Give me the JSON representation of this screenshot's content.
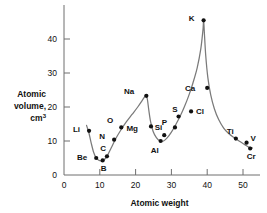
{
  "chart_data": {
    "type": "line",
    "title": "",
    "xlabel": "Atomic weight",
    "ylabel": "Atomic volume, cm3",
    "ylabel_lines": [
      "Atomic",
      "volume,",
      "cm"
    ],
    "ylabel_superscript": "3",
    "xlim": [
      0,
      53
    ],
    "ylim": [
      0,
      46
    ],
    "xticks": [
      0,
      10,
      20,
      30,
      40,
      50
    ],
    "yticks": [
      0,
      10,
      20,
      30,
      40
    ],
    "xtick_labels": [
      "0",
      "10",
      "20",
      "30",
      "40",
      "50"
    ],
    "ytick_labels": [
      "0",
      "10",
      "20",
      "30",
      "40"
    ],
    "grid": false,
    "legend": false,
    "series_name": "Atomic volume",
    "points": [
      {
        "label": "Li",
        "x": 7.0,
        "y": 13.0,
        "lx": -9,
        "ly": 1
      },
      {
        "label": "Be",
        "x": 9.0,
        "y": 5.0,
        "lx": -9,
        "ly": 2
      },
      {
        "label": "B",
        "x": 10.8,
        "y": 4.3,
        "lx": 1,
        "ly": 11
      },
      {
        "label": "C",
        "x": 12.0,
        "y": 5.5,
        "lx": -1,
        "ly": -5
      },
      {
        "label": "N",
        "x": 14.0,
        "y": 10.4,
        "lx": -9,
        "ly": -1
      },
      {
        "label": "O",
        "x": 16.0,
        "y": 14.0,
        "lx": -8,
        "ly": -4
      },
      {
        "label": "Na",
        "x": 23.0,
        "y": 23.3,
        "lx": -12,
        "ly": -2
      },
      {
        "label": "Mg",
        "x": 24.3,
        "y": 14.3,
        "lx": -13,
        "ly": 5
      },
      {
        "label": "Al",
        "x": 27.0,
        "y": 10.0,
        "lx": -2,
        "ly": 12
      },
      {
        "label": "Si",
        "x": 28.0,
        "y": 11.7,
        "lx": -2,
        "ly": -5
      },
      {
        "label": "P",
        "x": 31.0,
        "y": 14.0,
        "lx": -8,
        "ly": -2
      },
      {
        "label": "S",
        "x": 32.0,
        "y": 17.2,
        "lx": -1,
        "ly": -5
      },
      {
        "label": "Cl",
        "x": 35.5,
        "y": 18.7,
        "lx": 5,
        "ly": 3
      },
      {
        "label": "K",
        "x": 39.0,
        "y": 45.5,
        "lx": -9,
        "ly": 1
      },
      {
        "label": "Ca",
        "x": 40.0,
        "y": 25.6,
        "lx": -12,
        "ly": 3
      },
      {
        "label": "Ti",
        "x": 48.0,
        "y": 10.7,
        "lx": -2,
        "ly": -5
      },
      {
        "label": "V",
        "x": 51.0,
        "y": 9.5,
        "lx": 4,
        "ly": -2
      },
      {
        "label": "Cr",
        "x": 52.0,
        "y": 7.8,
        "lx": 1,
        "ly": 11
      }
    ],
    "curve_description": "Periodic curve of atomic volume versus atomic weight showing minima at B and Al and sharp maxima at Li, Na and K"
  }
}
